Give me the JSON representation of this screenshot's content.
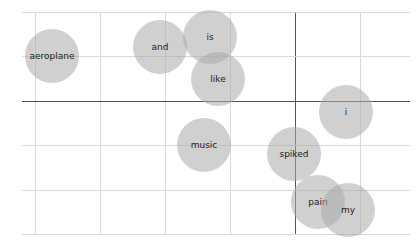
{
  "chart_data": {
    "type": "scatter",
    "title": "",
    "xlabel": "",
    "ylabel": "",
    "grid": true,
    "legend": "none",
    "marker": "bubble",
    "bubble_color": "#aaaaaa",
    "points": [
      {
        "label": "aeroplane",
        "x": 52,
        "y": 56,
        "r": 27
      },
      {
        "label": "and",
        "x": 160,
        "y": 47,
        "r": 27
      },
      {
        "label": "is",
        "x": 210,
        "y": 37,
        "r": 27
      },
      {
        "label": "like",
        "x": 218,
        "y": 79,
        "r": 27
      },
      {
        "label": "i",
        "x": 346,
        "y": 112,
        "r": 27
      },
      {
        "label": "music",
        "x": 204,
        "y": 145,
        "r": 27
      },
      {
        "label": "spiked",
        "x": 294,
        "y": 154,
        "r": 27
      },
      {
        "label": "pain",
        "x": 318,
        "y": 202,
        "r": 27
      },
      {
        "label": "my",
        "x": 348,
        "y": 210,
        "r": 27
      }
    ],
    "gridlines_x_px": [
      35,
      100,
      165,
      230,
      295,
      360
    ],
    "gridlines_y_px": [
      12,
      56,
      101,
      145,
      190,
      234
    ],
    "axis_x_px": 295,
    "axis_y_px": 101
  }
}
